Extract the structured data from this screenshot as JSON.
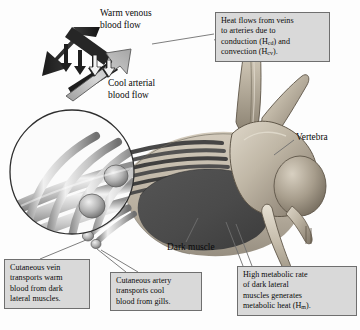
{
  "figure": {
    "background_color": "#fdfdfd"
  },
  "labels": {
    "warm_venous": "Warm venous\nblood flow",
    "warm_venous_line1": "Warm venous",
    "warm_venous_line2": "blood flow",
    "cool_arterial_line1": "Cool arterial",
    "cool_arterial_line2": "blood flow",
    "vertebra": "Vertebra",
    "dark_muscle": "Dark muscle"
  },
  "callouts": {
    "heat_flow": {
      "line1": "Heat flows from veins",
      "line2": "to arteries due to",
      "line3_pre": "conduction (H",
      "line3_sub": "cd",
      "line3_post": ") and",
      "line4_pre": "convection (H",
      "line4_sub": "cv",
      "line4_post": ")."
    },
    "metabolic": {
      "line1": "High metabolic rate",
      "line2": "of dark lateral",
      "line3": "muscles generates",
      "line4_pre": "metabolic heat (H",
      "line4_sub": "m",
      "line4_post": ")."
    },
    "cutaneous_vein": {
      "line1": "Cutaneous vein",
      "line2": "transports warm",
      "line3": "blood from dark",
      "line4": "lateral muscles."
    },
    "cutaneous_artery": {
      "line1": "Cutaneous artery",
      "line2": "transports cool",
      "line3": "blood from gills."
    }
  },
  "colors": {
    "box_fill": "#d9d9d9",
    "box_border": "#6f6f6f",
    "dark_muscle": "#4a4a4a",
    "vertebra_light": "#cfc7b8",
    "vertebra_mid": "#a89e8e",
    "vertebra_shadow": "#6b6256",
    "vein_arrow_dark": "#2c2c2c",
    "artery_arrow_light": "#b8b8b8",
    "vessel_light": "#e6e6e6",
    "vessel_mid": "#9a9a9a",
    "leader_line": "#6f6f6f",
    "text": "#0a0a0a"
  },
  "diagram_elements": {
    "inset_circle": {
      "name": "magnified-rete-mirabile",
      "center_x": 72,
      "center_y": 172,
      "radius": 62,
      "description": "Magnified view of parallel counter-current blood vessels with transverse cross vessels"
    },
    "arrows": {
      "venous_direction": "up-left",
      "arterial_direction": "up-right",
      "heat_transfer_arrow_count": 4,
      "heat_transfer_direction": "down"
    },
    "body_section": {
      "dark_muscle_shape": "oval",
      "muscle_fiber_band_count": 6,
      "vertebra_position": "dorsal-right"
    }
  }
}
